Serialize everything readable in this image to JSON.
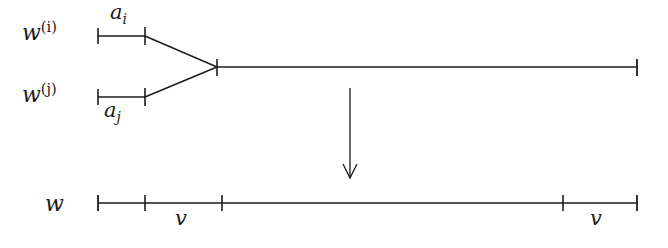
{
  "figure": {
    "name": "merge-diagram",
    "background_color": "#ffffff",
    "stroke_color": "#1b1b1b",
    "labels": {
      "source_top_base": "w",
      "source_top_sup": "(i)",
      "source_bottom_base": "w",
      "source_bottom_sup": "(j)",
      "span_top_base": "a",
      "span_top_sub": "i",
      "span_bottom_base": "a",
      "span_bottom_sub": "j",
      "target_base": "w",
      "target_span_left": "v",
      "target_span_right": "v"
    },
    "geometry": {
      "top_branch_y": 36,
      "bottom_branch_y": 97,
      "merged_line_y": 67,
      "target_line_y": 203,
      "segment_start_x": 98,
      "segment_end_x": 145,
      "junction_x": 217,
      "right_end_x": 637,
      "arrow_x": 350,
      "arrow_top_y": 88,
      "arrow_bottom_y": 178,
      "target_ticks": [
        98,
        145,
        222,
        563,
        637
      ]
    }
  }
}
